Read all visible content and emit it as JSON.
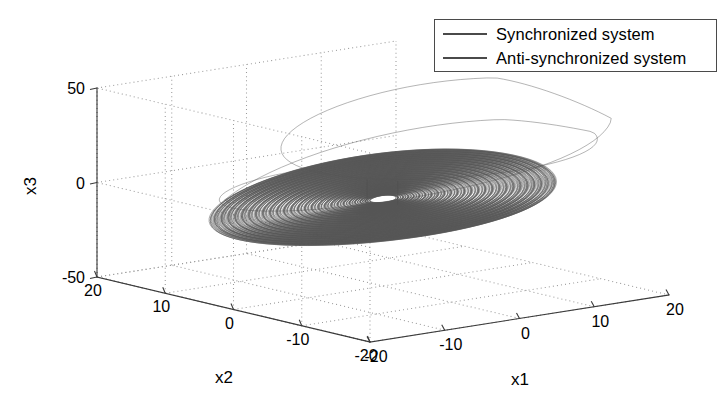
{
  "chart_data": {
    "type": "line",
    "projection": "3d",
    "title": "",
    "xlabel": "x1",
    "ylabel": "x2",
    "zlabel": "x3",
    "xlim": [
      -20,
      20
    ],
    "ylim": [
      -20,
      20
    ],
    "zlim": [
      -50,
      50
    ],
    "xticks": [
      -20,
      -10,
      0,
      10,
      20
    ],
    "yticks": [
      20,
      10,
      0,
      -10,
      -20
    ],
    "zticks": [
      50,
      0,
      -50
    ],
    "xtick_labels": [
      "-20",
      "-10",
      "0",
      "10",
      "20"
    ],
    "ytick_labels": [
      "20",
      "10",
      "0",
      "-10",
      "-20"
    ],
    "ztick_labels": [
      "50",
      "0",
      "-50"
    ],
    "grid": true,
    "grid_style": "dotted",
    "legend_position": "top-right",
    "series": [
      {
        "name": "Synchronized system",
        "color": "#4d4d4d",
        "system": "chaotic-attractor",
        "description": "Dense flat elliptical spiral disc in x1-x2 plane with two out-of-plane excursions: left lobe dips downward, right lobe arcs upward",
        "params": {
          "a": 35.0,
          "b": 3.0,
          "c": 28.0,
          "dt": 0.0018,
          "steps": 13000,
          "x0": 0.9,
          "y0": 0.4,
          "z0": 0.2,
          "seed": 7
        }
      },
      {
        "name": "Anti-synchronized system",
        "color": "#555555",
        "system": "chaotic-attractor",
        "description": "Overlapping mirrored trajectory tracing the same attractor geometry",
        "params": {
          "a": 35.0,
          "b": 3.0,
          "c": 28.0,
          "dt": 0.0018,
          "steps": 13000,
          "x0": -0.8,
          "y0": -0.5,
          "z0": -0.3,
          "seed": 23
        }
      }
    ]
  },
  "legend": {
    "entries": [
      {
        "label": "Synchronized system"
      },
      {
        "label": "Anti-synchronized system"
      }
    ]
  },
  "axes": {
    "x1_title": "x1",
    "x2_title": "x2",
    "x3_title": "x3",
    "x1_ticks": [
      "-20",
      "-10",
      "0",
      "10",
      "20"
    ],
    "x2_ticks": [
      "20",
      "10",
      "0",
      "-10",
      "-20"
    ],
    "x3_ticks": [
      "50",
      "0",
      "-50"
    ]
  },
  "geometry": {
    "origin_corner": [
      97,
      277
    ],
    "left_corner": [
      370,
      342
    ],
    "right_corner": [
      669,
      295
    ],
    "back_corner": [
      396,
      232
    ],
    "z_top_left": [
      97,
      88
    ],
    "note": "MATLAB default 3-D view box projection"
  },
  "colors": {
    "background": "#ffffff",
    "axis": "#3a3a3a",
    "grid": "#9a9a9a",
    "trajectory": "#4d4d4d",
    "text": "#000000",
    "legend_border": "#4a4a4a"
  }
}
